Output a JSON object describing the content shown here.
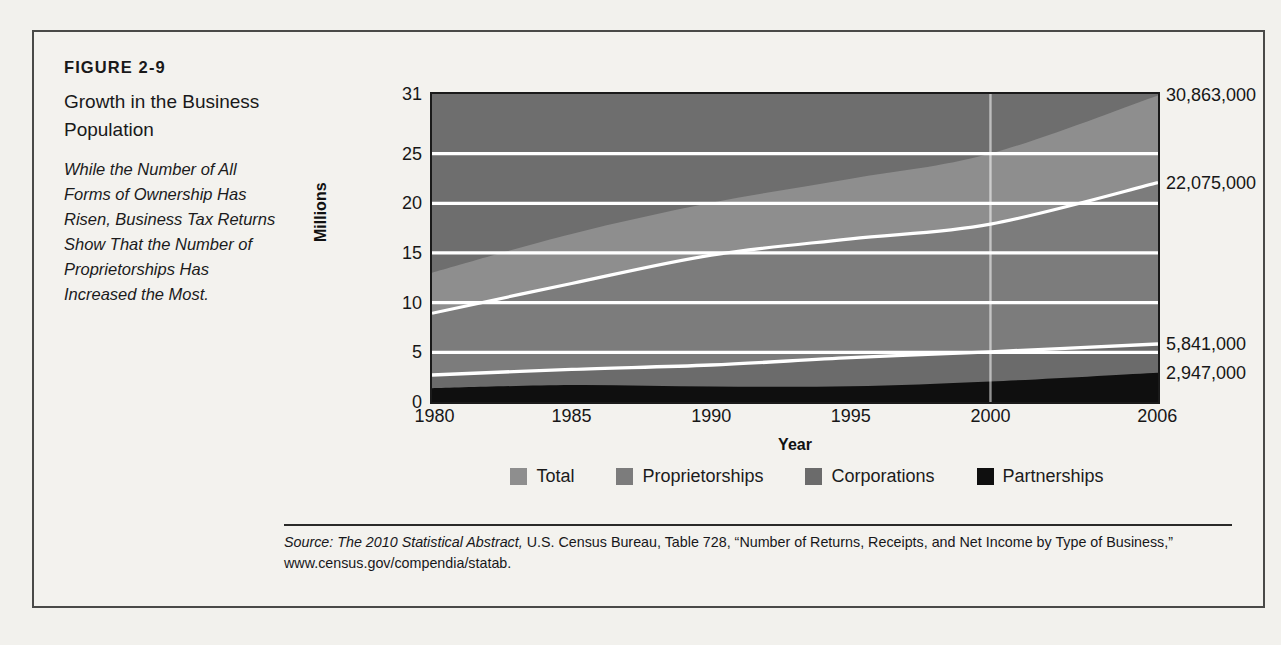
{
  "figure": {
    "number": "FIGURE 2-9",
    "title": "Growth in the Business Population",
    "description": "While the Number of All Forms of Ownership Has Risen, Business Tax Returns Show That the Number of Proprietorships Has Increased the Most.",
    "source_prefix": "Source:",
    "source_italic": "The 2010 Statistical Abstract,",
    "source_rest": " U.S. Census Bureau, Table 728, “Number of Returns, Receipts, and Net Income by Type of Business,” www.census.gov/compendia/statab."
  },
  "chart_data": {
    "type": "area",
    "title": "Growth in the Business Population",
    "xlabel": "Year",
    "ylabel": "Millions",
    "xlim": [
      1980,
      2006
    ],
    "ylim": [
      0,
      31
    ],
    "grid": true,
    "gridlines": [
      5,
      10,
      15,
      20,
      25
    ],
    "legend_position": "bottom",
    "stacked": true,
    "x_ticks": [
      "1980",
      "1985",
      "1990",
      "1995",
      "2000",
      "2006"
    ],
    "x_tick_values": [
      1980,
      1985,
      1990,
      1995,
      2000,
      2006
    ],
    "y_ticks": [
      "0",
      "5",
      "10",
      "15",
      "20",
      "25",
      "31"
    ],
    "y_tick_values": [
      0,
      5,
      10,
      15,
      20,
      25,
      31
    ],
    "x": [
      1980,
      1985,
      1990,
      1995,
      2000,
      2006
    ],
    "series": [
      {
        "name": "Partnerships",
        "color": "#0f0f0f",
        "values": [
          1.38,
          1.71,
          1.55,
          1.58,
          2.06,
          2.95
        ],
        "end_label": "2,947,000"
      },
      {
        "name": "Corporations",
        "color": "#6b6b6b",
        "values": [
          2.71,
          3.28,
          3.72,
          4.47,
          5.05,
          5.84
        ],
        "end_label": "5,841,000"
      },
      {
        "name": "Proprietorships",
        "color": "#7c7c7c",
        "values": [
          8.93,
          11.93,
          14.78,
          16.42,
          17.9,
          22.08
        ],
        "end_label": "22,075,000"
      },
      {
        "name": "Total",
        "color": "#8e8e8e",
        "values": [
          13.02,
          16.92,
          20.05,
          22.47,
          25.01,
          30.86
        ],
        "end_label": "30,863,000"
      }
    ],
    "right_labels": [
      {
        "text": "30,863,000",
        "value": 30.863
      },
      {
        "text": "22,075,000",
        "value": 22.075
      },
      {
        "text": "5,841,000",
        "value": 5.841
      },
      {
        "text": "2,947,000",
        "value": 2.947
      }
    ],
    "legend": [
      {
        "label": "Total",
        "color": "#8e8e8e"
      },
      {
        "label": "Proprietorships",
        "color": "#7c7c7c"
      },
      {
        "label": "Corporations",
        "color": "#6b6b6b"
      },
      {
        "label": "Partnerships",
        "color": "#0f0f0f"
      }
    ],
    "marker_line_year": 2000,
    "plot_background": "#6e6e6e",
    "gridline_color": "#ffffff"
  }
}
